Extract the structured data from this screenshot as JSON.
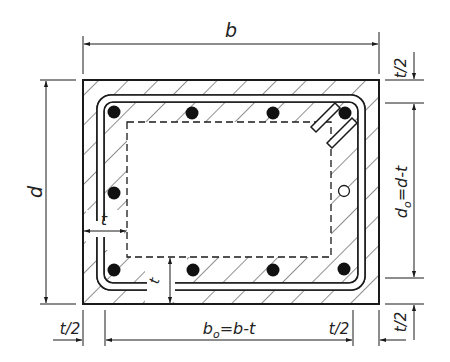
{
  "diagram": {
    "colors": {
      "line": "#1a1a1a",
      "hatch": "#333333",
      "background": "#ffffff"
    },
    "labels": {
      "width": "b",
      "depth": "d",
      "wall_thickness": "t",
      "wall_thickness_bottom": "t",
      "half_t_top_right": "t/2",
      "half_t_bottom_right": "t/2",
      "reduced_depth": "d",
      "reduced_depth_sub": "o",
      "reduced_depth_expr": "=d-t",
      "half_t_bottom_left": "t/2",
      "reduced_width": "b",
      "reduced_width_sub": "o",
      "reduced_width_expr": "=b-t",
      "half_t_bottom_mid_right": "t/2"
    },
    "elements": {
      "outer_section": "concrete section (hatched)",
      "effective_core": "dashed inner core",
      "stirrup": "closed stirrup with 135° hooks",
      "longitudinal_bars_filled": 9,
      "longitudinal_bars_hollow": 1
    }
  }
}
